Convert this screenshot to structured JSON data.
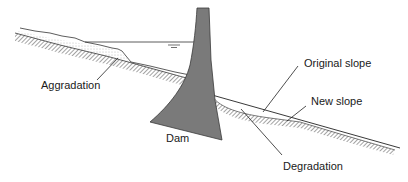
{
  "diagram": {
    "title": "",
    "labels": {
      "aggradation": "Aggradation",
      "dam": "Dam",
      "original_slope": "Original slope",
      "new_slope": "New slope",
      "degradation": "Degradation"
    },
    "colors": {
      "dam_fill": "#7a7a7a",
      "line": "#222222",
      "hatch": "#555555",
      "background": "#ffffff"
    }
  }
}
